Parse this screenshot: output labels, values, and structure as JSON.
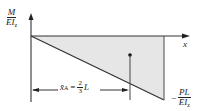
{
  "diagram": {
    "y_axis_label": {
      "numerator": "M",
      "denominator": "EI",
      "denominator_sub": "z"
    },
    "x_axis_label": "x",
    "min_value_label": {
      "sign": "−",
      "numerator": "PL",
      "denominator": "EI",
      "denominator_sub": "z"
    },
    "centroid_label": {
      "symbol": "x̄",
      "sub": "A",
      "equals": "=",
      "frac_num": "2",
      "frac_den": "3",
      "var": "L"
    },
    "colors": {
      "fill": "#e6e6e6",
      "stroke": "#333333",
      "text": "#222222"
    }
  }
}
